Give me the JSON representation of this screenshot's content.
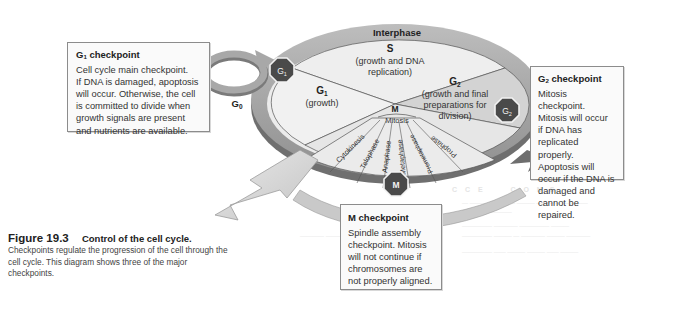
{
  "figure": {
    "number": "Figure 19.3",
    "title": "Control of the cell cycle.",
    "description": "Checkpoints regulate the progression of the cell through the cell cycle. This diagram shows three of the major checkpoints."
  },
  "diagram": {
    "interphase_label": "Interphase",
    "g0_label": "G",
    "g0_sub": "0",
    "phases": {
      "s": {
        "name": "S",
        "detail_line1": "(growth and DNA",
        "detail_line2": "replication)"
      },
      "g1": {
        "name": "G",
        "sub": "1",
        "detail": "(growth)"
      },
      "g2": {
        "name": "G",
        "sub": "2",
        "detail_line1": "(growth and final",
        "detail_line2": "preparations for",
        "detail_line3": "division)"
      },
      "m": {
        "name": "M",
        "mitosis_label": "Mitosis"
      }
    },
    "mitosis_stages": [
      "Cytokinesis",
      "Telophase",
      "Anaphase",
      "Metaphase",
      "Prometaphase",
      "Prophase"
    ],
    "checkpoint_badges": {
      "g1": {
        "label": "G",
        "sub": "1"
      },
      "g2": {
        "label": "G",
        "sub": "2"
      },
      "m": {
        "label": "M"
      }
    },
    "colors": {
      "ring": "#a9a9a9",
      "ring_dark": "#7d7d7d",
      "center_light": "#ececec",
      "center_mid": "#d6d6d6",
      "badge": "#4a4a4a",
      "badge_border": "#f2f2f2"
    }
  },
  "callouts": {
    "g1": {
      "title": "G",
      "title_sub": "1",
      "title_rest": " checkpoint",
      "lines": [
        "Cell cycle main checkpoint.",
        "If DNA is damaged, apoptosis",
        "will occur. Otherwise, the cell",
        "is committed to divide when",
        "growth signals are present",
        "and nutrients are available."
      ]
    },
    "g2": {
      "title": "G",
      "title_sub": "2",
      "title_rest": " checkpoint",
      "lines": [
        "Mitosis checkpoint.",
        "Mitosis will occur",
        "if DNA has",
        "replicated properly.",
        "Apoptosis will",
        "occur if the DNA is",
        "damaged and",
        "cannot be repaired."
      ]
    },
    "m": {
      "title": "M checkpoint",
      "lines": [
        "Spindle assembly",
        "checkpoint. Mitosis",
        "will not continue if",
        "chromosomes are",
        "not properly aligned."
      ]
    }
  }
}
